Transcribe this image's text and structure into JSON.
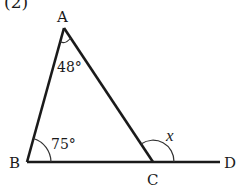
{
  "problem_label": "(2)",
  "points": {
    "A": {
      "label": "A",
      "x": 64,
      "y": 28
    },
    "B": {
      "label": "B",
      "x": 27,
      "y": 162
    },
    "C": {
      "label": "C",
      "x": 153,
      "y": 162
    },
    "D": {
      "label": "D",
      "x": 220,
      "y": 162
    }
  },
  "angles": {
    "A": {
      "label": "48°"
    },
    "B": {
      "label": "75°"
    },
    "ACD": {
      "label": "x"
    }
  },
  "colors": {
    "line": "#1a1a1a",
    "arc": "#333333",
    "background": "#ffffff"
  }
}
